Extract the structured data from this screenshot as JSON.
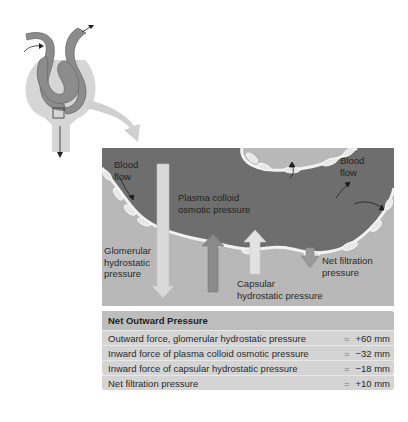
{
  "diagram": {
    "labels": {
      "blood_flow_left": "Blood\nflow",
      "blood_flow_right": "Blood\nflow",
      "plasma_colloid": "Plasma colloid\nosmotic pressure",
      "glomerular": "Glomerular\nhydrostatic\npressure",
      "capsular": "Capsular\nhydrostatic pressure",
      "net_filtration": "Net filtration\npressure"
    },
    "colors": {
      "capillary": "#6e6e6e",
      "capsule_space": "#b8b8b8",
      "glomerular_arrow": "#d9d9d9",
      "plasma_arrow": "#8a8a8a",
      "capsular_arrow": "#e2e2e2",
      "net_arrow": "#9a9a9a",
      "table_bg": "#d4d4d4",
      "table_header": "#bdbdbd"
    }
  },
  "table": {
    "title": "Net Outward Pressure",
    "rows": [
      {
        "label": "Outward force, glomerular hydrostatic pressure",
        "eq": "=",
        "value": "+60 mm"
      },
      {
        "label": "Inward force of plasma colloid osmotic pressure",
        "eq": "=",
        "value": "−32 mm"
      },
      {
        "label": "Inward force of capsular hydrostatic pressure",
        "eq": "=",
        "value": "−18 mm"
      },
      {
        "label": "Net filtration pressure",
        "eq": "=",
        "value": "+10 mm"
      }
    ]
  }
}
